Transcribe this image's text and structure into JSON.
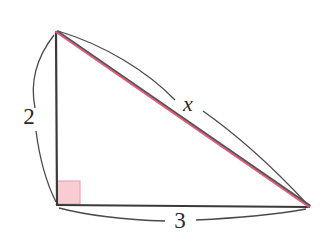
{
  "figure": {
    "kind": "right-triangle-diagram",
    "background_color": "#ffffff",
    "width": 325,
    "height": 244
  },
  "colors": {
    "leg_stroke": "#3a3a3a",
    "hypotenuse_stroke": "#e0607a",
    "hypotenuse_shadow": "#555555",
    "arc_stroke": "#4a4a4a",
    "right_angle_fill": "#f8ccd2",
    "right_angle_border": "#e9a9b5",
    "label_color": "#2b2b2b"
  },
  "vertices": {
    "apex": {
      "name": "top-vertex",
      "x": 56,
      "y": 32
    },
    "right_angle": {
      "name": "bottom-left-vertex",
      "x": 57,
      "y": 205
    },
    "far": {
      "name": "bottom-right-vertex",
      "x": 309,
      "y": 207
    }
  },
  "right_angle_marker": {
    "name": "right-angle-square",
    "x": 57,
    "y": 181,
    "size": 23
  },
  "sides": [
    {
      "id": "vertical-leg",
      "name": "vertical-leg",
      "label": "2",
      "label_x": 29,
      "label_y": 119,
      "stroke": "#3a3a3a",
      "from": "apex",
      "to": "right_angle"
    },
    {
      "id": "horizontal-leg",
      "name": "horizontal-leg",
      "label": "3",
      "label_x": 180,
      "label_y": 223,
      "stroke": "#3a3a3a",
      "from": "right_angle",
      "to": "far"
    },
    {
      "id": "hypotenuse",
      "name": "hypotenuse",
      "label": "x",
      "label_x": 188,
      "label_y": 106,
      "stroke": "#e0607a",
      "from": "apex",
      "to": "far"
    }
  ],
  "arcs": [
    {
      "id": "arc-vertical",
      "name": "measure-arc-vertical",
      "segment_a": "M 54 35 C 33 62 31 88 35 108",
      "segment_b": "M 36 131 C 39 154 45 180 56 202"
    },
    {
      "id": "arc-horizontal",
      "name": "measure-arc-horizontal",
      "segment_a": "M 59 208 C 90 216 130 220 165 221",
      "segment_b": "M 196 220 C 238 218 278 214 306 209"
    },
    {
      "id": "arc-hypotenuse",
      "name": "measure-arc-hypotenuse",
      "segment_a": "M 58 31 C 105 45 148 72 175 100",
      "segment_b": "M 203 111 C 244 140 283 178 307 204"
    }
  ],
  "chart_data": {
    "type": "diagram",
    "title": "",
    "shape": "right triangle",
    "labels": [
      "2",
      "3",
      "x"
    ],
    "known_sides": [
      {
        "side": "vertical leg",
        "value": "2"
      },
      {
        "side": "horizontal leg",
        "value": "3"
      }
    ],
    "unknown_sides": [
      {
        "side": "hypotenuse",
        "value": "x"
      }
    ],
    "right_angle_at": "bottom-left vertex"
  }
}
